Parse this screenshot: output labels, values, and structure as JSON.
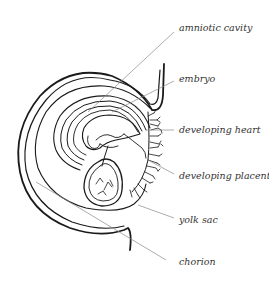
{
  "figure": {
    "labels": [
      {
        "id": "amniotic-cavity",
        "text": "amniotic cavity",
        "x": 179,
        "y": 22
      },
      {
        "id": "embryo",
        "text": "embryo",
        "x": 179,
        "y": 73
      },
      {
        "id": "developing-heart",
        "text": "developing heart",
        "x": 179,
        "y": 124
      },
      {
        "id": "developing-placenta",
        "text": "developing placenta",
        "x": 179,
        "y": 170
      },
      {
        "id": "yolk-sac",
        "text": "yolk sac",
        "x": 179,
        "y": 214
      },
      {
        "id": "chorion",
        "text": "chorion",
        "x": 179,
        "y": 261
      }
    ],
    "colors": {
      "line": "#1a1a1a",
      "leader": "#8a8a8a",
      "text": "#333333",
      "background": "#ffffff"
    }
  }
}
